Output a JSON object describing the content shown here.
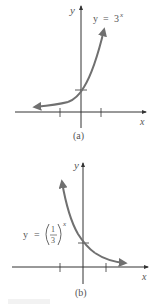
{
  "figure": {
    "panels": [
      {
        "id": "a",
        "label": "(a)",
        "equation_lhs": "y",
        "equation_eq": "=",
        "equation_base": "3",
        "equation_exp": "x",
        "x_axis_label": "x",
        "y_axis_label": "y"
      },
      {
        "id": "b",
        "label": "(b)",
        "equation_lhs": "y",
        "equation_eq": "=",
        "equation_num": "1",
        "equation_den": "3",
        "equation_exp": "x",
        "x_axis_label": "x",
        "y_axis_label": "y"
      }
    ],
    "colors": {
      "axis": "#333333",
      "curve": "#707070",
      "text": "#555555"
    }
  }
}
